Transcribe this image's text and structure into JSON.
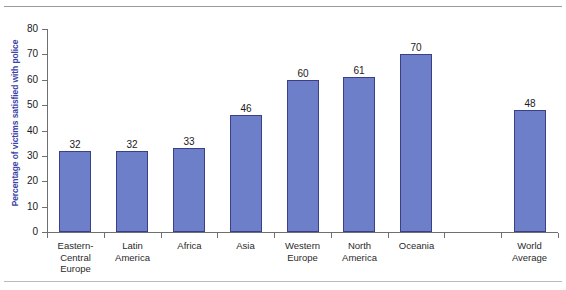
{
  "chart_data": {
    "type": "bar",
    "title": "",
    "xlabel": "",
    "ylabel": "Percentage of victims satisfied with police",
    "ylim": [
      0,
      80
    ],
    "yticks": [
      0,
      10,
      20,
      30,
      40,
      50,
      60,
      70,
      80
    ],
    "grid": false,
    "legend": "none",
    "bar_color": "#6d7fc9",
    "bar_border_color": "#3b3f86",
    "axis_title_color": "#3a42a8",
    "categories": [
      "Eastern-\nCentral\nEurope",
      "Latin\nAmerica",
      "Africa",
      "Asia",
      "Western\nEurope",
      "North\nAmerica",
      "Oceania",
      "",
      "World\nAverage"
    ],
    "values": [
      32,
      32,
      33,
      46,
      60,
      61,
      70,
      null,
      48
    ],
    "series": [
      {
        "name": "Percentage of victims satisfied with police",
        "values": [
          32,
          32,
          33,
          46,
          60,
          61,
          70,
          null,
          48
        ]
      }
    ],
    "points": [
      {
        "category": "Eastern-Central Europe",
        "label_lines": [
          "Eastern-",
          "Central",
          "Europe"
        ],
        "value": 32,
        "value_label": "32"
      },
      {
        "category": "Latin America",
        "label_lines": [
          "Latin",
          "America"
        ],
        "value": 32,
        "value_label": "32"
      },
      {
        "category": "Africa",
        "label_lines": [
          "Africa"
        ],
        "value": 33,
        "value_label": "33"
      },
      {
        "category": "Asia",
        "label_lines": [
          "Asia"
        ],
        "value": 46,
        "value_label": "46"
      },
      {
        "category": "Western Europe",
        "label_lines": [
          "Western",
          "Europe"
        ],
        "value": 60,
        "value_label": "60"
      },
      {
        "category": "North America",
        "label_lines": [
          "North",
          "America"
        ],
        "value": 61,
        "value_label": "61"
      },
      {
        "category": "Oceania",
        "label_lines": [
          "Oceania"
        ],
        "value": 70,
        "value_label": "70"
      },
      {
        "category": "",
        "label_lines": [],
        "value": null,
        "value_label": ""
      },
      {
        "category": "World Average",
        "label_lines": [
          "World",
          "Average"
        ],
        "value": 48,
        "value_label": "48"
      }
    ]
  }
}
